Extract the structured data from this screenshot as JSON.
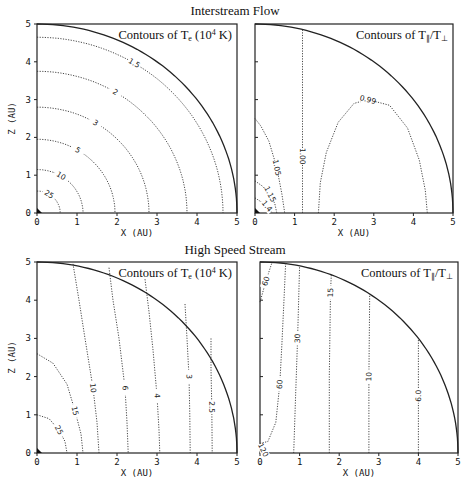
{
  "sections": {
    "top_title": "Interstream Flow",
    "bottom_title": "High Speed Stream"
  },
  "chart_data": [
    {
      "id": "interstream-te",
      "type": "contour",
      "section": "Interstream Flow",
      "title": "Contours of T",
      "title_sub": "e",
      "title_suffix": " (10",
      "title_sup": "4",
      "title_end": " K)",
      "xlabel": "X  (AU)",
      "ylabel": "Z  (AU)",
      "xlim": [
        0,
        5
      ],
      "ylim": [
        0,
        5
      ],
      "xticks": [
        "0",
        "1",
        "2",
        "3",
        "4",
        "5"
      ],
      "yticks": [
        "0",
        "1",
        "2",
        "3",
        "4",
        "5"
      ],
      "boundary": "quarter circle r = 5 AU",
      "contours": [
        {
          "label": "25",
          "shape": "arc",
          "r": 0.58
        },
        {
          "label": "10",
          "shape": "arc",
          "r": 1.15
        },
        {
          "label": "5",
          "shape": "arc",
          "r": 1.95
        },
        {
          "label": "3",
          "shape": "arc",
          "r": 2.8
        },
        {
          "label": "2",
          "shape": "arc",
          "r": 3.75
        },
        {
          "label": "1.5",
          "shape": "arc",
          "r": 4.65
        }
      ]
    },
    {
      "id": "interstream-ratio",
      "type": "contour",
      "section": "Interstream Flow",
      "title": "Contours of T",
      "title_sub": "∥",
      "title_suffix": "/T",
      "title_sub2": "⊥",
      "xlabel": "X  (AU)",
      "ylabel": "",
      "xlim": [
        0,
        5
      ],
      "ylim": [
        0,
        5
      ],
      "xticks": [
        "0",
        "1",
        "2",
        "3",
        "4",
        "5"
      ],
      "yticks": [],
      "boundary": "quarter circle r = 5 AU",
      "contours": [
        {
          "label": "1.4",
          "points": [
            [
              0,
              0.4
            ],
            [
              0.15,
              0.3
            ],
            [
              0.3,
              0.18
            ],
            [
              0.4,
              0.05
            ],
            [
              0.45,
              0
            ]
          ]
        },
        {
          "label": "1.15",
          "points": [
            [
              0,
              0.85
            ],
            [
              0.2,
              0.7
            ],
            [
              0.38,
              0.5
            ],
            [
              0.5,
              0.25
            ],
            [
              0.55,
              0
            ]
          ]
        },
        {
          "label": "1.05",
          "points": [
            [
              0,
              2.5
            ],
            [
              0.15,
              2.3
            ],
            [
              0.35,
              1.9
            ],
            [
              0.55,
              1.2
            ],
            [
              0.68,
              0.5
            ],
            [
              0.75,
              0
            ]
          ]
        },
        {
          "label": "1.00",
          "points": [
            [
              1.2,
              4.85
            ],
            [
              1.2,
              3
            ],
            [
              1.2,
              1.5
            ],
            [
              1.2,
              0
            ]
          ]
        },
        {
          "label": "0.99",
          "points": [
            [
              1.6,
              0
            ],
            [
              1.65,
              0.8
            ],
            [
              1.8,
              1.6
            ],
            [
              2.1,
              2.4
            ],
            [
              2.5,
              2.9
            ],
            [
              2.85,
              3.0
            ],
            [
              3.4,
              2.85
            ],
            [
              3.85,
              2.25
            ],
            [
              4.15,
              1.4
            ],
            [
              4.3,
              0.6
            ],
            [
              4.35,
              0
            ]
          ]
        }
      ]
    },
    {
      "id": "highspeed-te",
      "type": "contour",
      "section": "High Speed Stream",
      "title": "Contours of T",
      "title_sub": "e",
      "title_suffix": " (10",
      "title_sup": "4",
      "title_end": " K)",
      "xlabel": "X  (AU)",
      "ylabel": "Z  (AU)",
      "xlim": [
        0,
        5
      ],
      "ylim": [
        0,
        5
      ],
      "xticks": [
        "0",
        "1",
        "2",
        "3",
        "4",
        "5"
      ],
      "yticks": [
        "0",
        "1",
        "2",
        "3",
        "4",
        "5"
      ],
      "boundary": "quarter circle r = 5 AU",
      "contours": [
        {
          "label": "25",
          "points": [
            [
              0,
              1.0
            ],
            [
              0.3,
              0.9
            ],
            [
              0.55,
              0.6
            ],
            [
              0.7,
              0.3
            ],
            [
              0.75,
              0
            ]
          ]
        },
        {
          "label": "15",
          "points": [
            [
              0,
              2.6
            ],
            [
              0.4,
              2.35
            ],
            [
              0.75,
              1.8
            ],
            [
              0.95,
              1.1
            ],
            [
              1.1,
              0.5
            ],
            [
              1.15,
              0
            ]
          ]
        },
        {
          "label": "10",
          "points": [
            [
              0.9,
              4.95
            ],
            [
              1.05,
              4.0
            ],
            [
              1.2,
              3.0
            ],
            [
              1.4,
              1.7
            ],
            [
              1.5,
              0.8
            ],
            [
              1.55,
              0
            ]
          ]
        },
        {
          "label": "6",
          "points": [
            [
              1.8,
              4.85
            ],
            [
              1.9,
              4.0
            ],
            [
              2.05,
              3.0
            ],
            [
              2.2,
              1.7
            ],
            [
              2.25,
              0.8
            ],
            [
              2.28,
              0
            ]
          ]
        },
        {
          "label": "4",
          "points": [
            [
              2.7,
              4.55
            ],
            [
              2.8,
              3.7
            ],
            [
              2.9,
              2.7
            ],
            [
              3.0,
              1.5
            ],
            [
              3.05,
              0.6
            ],
            [
              3.07,
              0
            ]
          ]
        },
        {
          "label": "3",
          "points": [
            [
              3.7,
              3.9
            ],
            [
              3.75,
              3.0
            ],
            [
              3.8,
              2.0
            ],
            [
              3.82,
              1.0
            ],
            [
              3.83,
              0
            ]
          ]
        },
        {
          "label": "2.5",
          "points": [
            [
              4.35,
              3.0
            ],
            [
              4.35,
              2.2
            ],
            [
              4.37,
              1.2
            ],
            [
              4.38,
              0
            ]
          ]
        }
      ]
    },
    {
      "id": "highspeed-ratio",
      "type": "contour",
      "section": "High Speed Stream",
      "title": "Contours of T",
      "title_sub": "∥",
      "title_suffix": "/T",
      "title_sub2": "⊥",
      "xlabel": "X  (AU)",
      "ylabel": "",
      "xlim": [
        0,
        5
      ],
      "ylim": [
        0,
        5
      ],
      "xticks": [
        "0",
        "1",
        "2",
        "3",
        "4",
        "5"
      ],
      "yticks": [],
      "boundary": "quarter circle r = 5 AU",
      "contours": [
        {
          "label": "120",
          "points": [
            [
              0,
              0.12
            ],
            [
              0.08,
              0.08
            ],
            [
              0.12,
              0
            ]
          ]
        },
        {
          "label": "60",
          "points": [
            [
              0,
              0.25
            ],
            [
              0.2,
              0.3
            ],
            [
              0.4,
              0.8
            ],
            [
              0.5,
              1.8
            ],
            [
              0.55,
              2.8
            ],
            [
              0.6,
              3.9
            ],
            [
              0.65,
              5.0
            ]
          ]
        },
        {
          "label": "60",
          "points": [
            [
              0,
              3.95
            ],
            [
              0.15,
              4.5
            ],
            [
              0.3,
              4.98
            ]
          ]
        },
        {
          "label": "30",
          "points": [
            [
              0.85,
              0
            ],
            [
              0.9,
              1.5
            ],
            [
              0.95,
              3
            ],
            [
              1.0,
              4.9
            ]
          ]
        },
        {
          "label": "15",
          "points": [
            [
              1.75,
              0
            ],
            [
              1.75,
              2
            ],
            [
              1.78,
              4.2
            ],
            [
              1.8,
              4.67
            ]
          ]
        },
        {
          "label": "10",
          "points": [
            [
              2.75,
              0
            ],
            [
              2.75,
              2
            ],
            [
              2.77,
              4.15
            ]
          ]
        },
        {
          "label": "6.0",
          "points": [
            [
              4.0,
              0
            ],
            [
              4.0,
              1.5
            ],
            [
              4.0,
              3.0
            ]
          ]
        }
      ]
    }
  ]
}
